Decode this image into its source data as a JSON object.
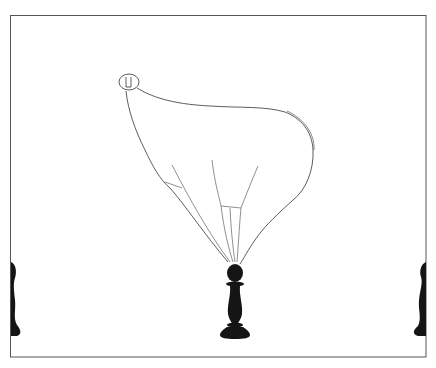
{
  "illustration": {
    "description": "Pen-and-ink drawing of a bulbous balloon-like form tethered by strings to a black chess pawn, framed by a thin rectangle with partial pawns at the left and right edges",
    "colors": {
      "background": "#ffffff",
      "ink": "#1a1a1a",
      "frame": "#555555"
    },
    "elements": [
      "frame",
      "balloon",
      "keyhole-head",
      "strings",
      "center-pawn",
      "left-pawn-partial",
      "right-pawn-partial"
    ]
  }
}
